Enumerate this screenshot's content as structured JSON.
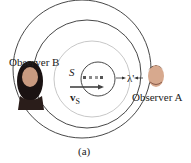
{
  "figure": {
    "caption": "(a)",
    "observer_b_label": "Observer B",
    "observer_a_label": "Observer A",
    "source_label": "S",
    "velocity_label": "v",
    "velocity_subscript": "S",
    "wavelength_label": "λ'",
    "colors": {
      "wavefront": "#333333",
      "inner_wavefront": "#c8c8c8",
      "arrow": "#444444"
    }
  }
}
